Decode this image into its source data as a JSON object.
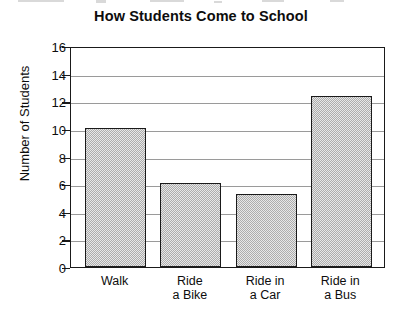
{
  "chart_data": {
    "type": "bar",
    "title": "How Students Come to School",
    "xlabel": "",
    "ylabel": "Number of Students",
    "categories": [
      "Walk",
      "Ride a Bike",
      "Ride in a Car",
      "Ride in a Bus"
    ],
    "category_lines": [
      [
        "Walk"
      ],
      [
        "Ride",
        "a Bike"
      ],
      [
        "Ride in",
        "a Car"
      ],
      [
        "Ride in",
        "a Bus"
      ]
    ],
    "values": [
      10.1,
      6.1,
      5.3,
      12.4
    ],
    "ylim": [
      0,
      16
    ],
    "ytick_labels": [
      "16",
      "14",
      "12",
      "10",
      "8",
      "6",
      "4",
      "2",
      "0"
    ],
    "ytick_values": [
      16,
      14,
      12,
      10,
      8,
      6,
      4,
      2,
      0
    ],
    "ytick_step": 2,
    "grid": true,
    "grid_orientation": "horizontal",
    "legend": null,
    "bar_fill_color": "#c9c9c9",
    "bar_edge_color": "#1a1a1a",
    "axis_color": "#1a1a1a",
    "grid_color": "#9a9a9a",
    "text_color": "#0d0d0d",
    "background_color": "#ffffff"
  }
}
